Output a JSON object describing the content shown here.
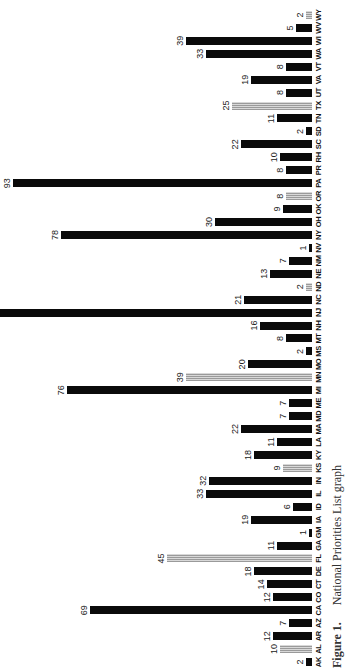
{
  "caption": {
    "figure": "Figure 1.",
    "text": "National Priorities List graph"
  },
  "chart_data": {
    "type": "bar",
    "orientation": "vertical bars, page rotated 90 degrees counter-clockwise",
    "title": "National Priorities List graph",
    "xlabel": "State",
    "ylabel": "Number of sites",
    "ylim": [
      0,
      97
    ],
    "grid": false,
    "legend": "none (gray hatched bars distinguish a subset of states)",
    "categories": [
      "AK",
      "AL",
      "AR",
      "AZ",
      "CA",
      "CO",
      "CT",
      "DE",
      "FL",
      "GA",
      "GM",
      "IA",
      "ID",
      "IL",
      "IN",
      "KS",
      "KY",
      "LA",
      "MA",
      "MD",
      "ME",
      "MI",
      "MN",
      "MO",
      "MS",
      "MT",
      "NH",
      "NJ",
      "NC",
      "ND",
      "NE",
      "NM",
      "NV",
      "NY",
      "OH",
      "OK",
      "OR",
      "PA",
      "PR",
      "RH",
      "SC",
      "SD",
      "TN",
      "TX",
      "UT",
      "VA",
      "VT",
      "WA",
      "WI",
      "WV",
      "WY"
    ],
    "values": [
      2,
      10,
      12,
      7,
      69,
      12,
      14,
      18,
      45,
      11,
      1,
      19,
      6,
      33,
      32,
      9,
      18,
      11,
      22,
      7,
      7,
      76,
      39,
      20,
      2,
      8,
      16,
      null,
      21,
      2,
      13,
      7,
      1,
      78,
      30,
      9,
      8,
      93,
      8,
      10,
      22,
      2,
      11,
      25,
      8,
      19,
      8,
      33,
      39,
      5,
      2
    ],
    "labels": [
      "2",
      "10",
      "12",
      "7",
      "69",
      "12",
      "14",
      "18",
      "45",
      "11",
      "1",
      "19",
      "6",
      "33",
      "32",
      "9",
      "18",
      "11",
      "22",
      "7",
      "7",
      "76",
      "39",
      "20",
      "2",
      "8",
      "16",
      "",
      "21",
      "2",
      "13",
      "7",
      "1",
      "78",
      "30",
      "9",
      "8",
      "93",
      "8",
      "10",
      "22",
      "2",
      "11",
      "25",
      "8",
      "19",
      "8",
      "33",
      "39",
      "5",
      "2"
    ],
    "gray": [
      false,
      true,
      false,
      false,
      false,
      false,
      false,
      false,
      true,
      false,
      false,
      false,
      false,
      false,
      false,
      true,
      false,
      false,
      false,
      false,
      false,
      false,
      true,
      false,
      false,
      false,
      false,
      false,
      false,
      true,
      false,
      false,
      false,
      false,
      false,
      false,
      true,
      false,
      false,
      false,
      false,
      false,
      false,
      true,
      false,
      false,
      false,
      false,
      false,
      false,
      true
    ],
    "annotations": [
      "NJ bar exceeds plot area (off-scale, unlabeled)"
    ]
  }
}
